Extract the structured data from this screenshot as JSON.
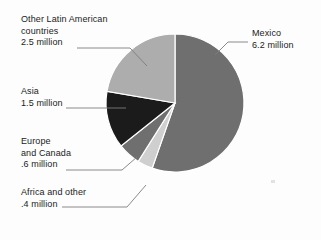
{
  "chart_data": {
    "type": "pie",
    "title": "",
    "unit": "million",
    "total": 11.2,
    "start_angle_deg": 0,
    "direction": "clockwise",
    "legend_position": "callout-labels",
    "grid": false,
    "categories": [
      "Mexico",
      "Other Latin American countries",
      "Asia",
      "Europe and Canada",
      "Africa and other"
    ],
    "values": [
      6.2,
      2.5,
      1.5,
      0.6,
      0.4
    ],
    "value_labels": [
      "6.2 million",
      "2.5 million",
      "1.5 million",
      ".6 million",
      ".4 million"
    ],
    "colors": [
      "#6f6f6f",
      "#adadad",
      "#1b1b1b",
      "#6f6f6f",
      "#cfcfcf"
    ],
    "slices": [
      {
        "name": "Mexico",
        "value": 6.2,
        "value_label": "6.2 million",
        "color": "#6f6f6f",
        "start_deg": 0,
        "end_deg": 199.3
      },
      {
        "name": "Africa and other",
        "value": 0.4,
        "value_label": ".4 million",
        "color": "#cfcfcf",
        "start_deg": 199.3,
        "end_deg": 212.2
      },
      {
        "name": "Europe and Canada",
        "value": 0.6,
        "value_label": ".6 million",
        "color": "#6f6f6f",
        "start_deg": 212.2,
        "end_deg": 231.5
      },
      {
        "name": "Asia",
        "value": 1.5,
        "value_label": "1.5 million",
        "color": "#1b1b1b",
        "start_deg": 231.5,
        "end_deg": 279.7
      },
      {
        "name": "Other Latin American countries",
        "value": 2.5,
        "value_label": "2.5 million",
        "color": "#adadad",
        "start_deg": 279.7,
        "end_deg": 360
      }
    ]
  },
  "labels": {
    "latin": {
      "line1": "Other Latin American",
      "line2": "countries",
      "line3": "2.5 million"
    },
    "asia": {
      "line1": "Asia",
      "line2": "1.5 million"
    },
    "europe": {
      "line1": "Europe",
      "line2": "and Canada",
      "line3": ".6 million"
    },
    "africa": {
      "line1": "Africa and other",
      "line2": ".4 million"
    },
    "mexico": {
      "line1": "Mexico",
      "line2": "6.2 million"
    }
  }
}
